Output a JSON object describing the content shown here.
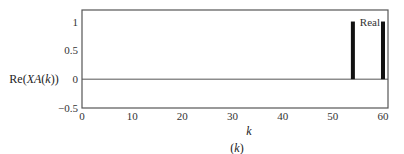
{
  "chart_data": {
    "type": "bar",
    "title": "",
    "caption": "(k)",
    "xlabel": "k",
    "ylabel": "Re(XA(k))",
    "xlim": [
      0,
      61
    ],
    "ylim": [
      -0.5,
      1.2
    ],
    "xticks": [
      0,
      10,
      20,
      30,
      40,
      50,
      60
    ],
    "yticks": [
      -0.5,
      0,
      0.5,
      1
    ],
    "ytick_labels": [
      "−0.5",
      "0",
      "0.5",
      "1"
    ],
    "grid": false,
    "legend": {
      "entries": [
        "Real"
      ],
      "position": "upper right"
    },
    "series": [
      {
        "name": "Real",
        "x": [
          54,
          60
        ],
        "values": [
          1,
          1
        ],
        "color": "#111111"
      }
    ],
    "zero_line": true
  }
}
